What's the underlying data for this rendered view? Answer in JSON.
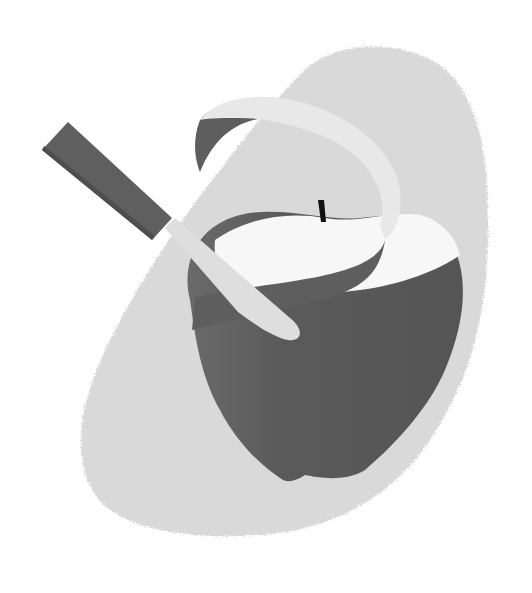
{
  "illustration": {
    "subject": "Apple being peeled with a knife",
    "alt": "Grayscale illustration of an apple with a spiral peel ribbon and a paring knife, over a textured blob background",
    "colors": {
      "background": "#ffffff",
      "blob": "#d9d9d9",
      "apple_skin": "#5c5c5c",
      "apple_flesh": "#f7f7f7",
      "peel_outer": "#e8e8e8",
      "peel_inner": "#5e5e5e",
      "knife_handle": "#5f5f5f",
      "knife_blade": "#dedede",
      "stem": "#111111"
    }
  }
}
